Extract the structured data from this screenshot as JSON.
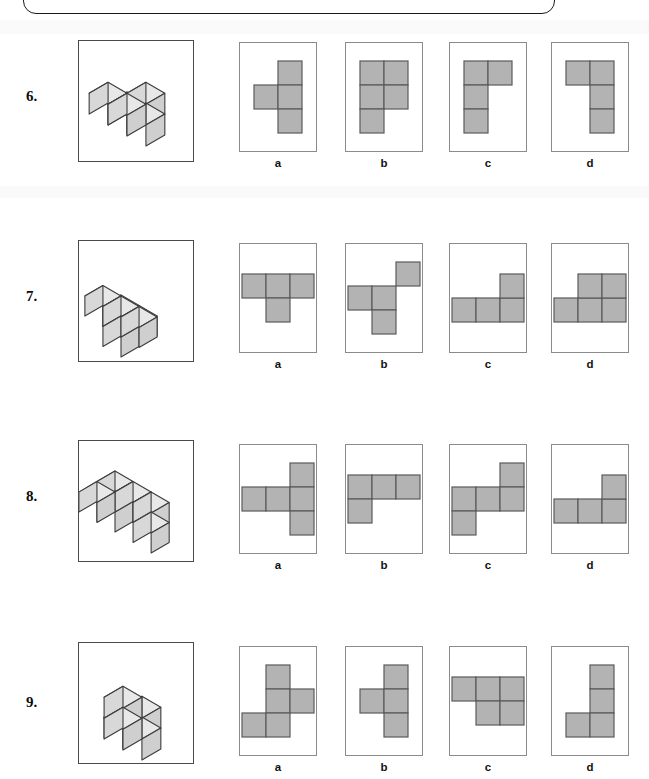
{
  "worksheet": {
    "kind": "spatial-visualization-multiple-choice",
    "instruction_box": {
      "present": true,
      "text": "",
      "note": "rounded box cropped at top of page"
    },
    "option_letters": [
      "a",
      "b",
      "c",
      "d"
    ],
    "colors": {
      "cell_fill": "#b3b3b3",
      "cell_stroke": "#5a5a5a",
      "panel_border": "#8b8b8b",
      "figure_border": "#4a4a4a",
      "cube_top": "#e8e8e8",
      "cube_front": "#d8d8d8",
      "cube_side": "#cfcfcf",
      "cube_stroke": "#3c3c3c",
      "text": "#111111",
      "page_background": "#ffffff"
    }
  },
  "questions": [
    {
      "number": "6.",
      "figure": {
        "name": "cube-stack-6",
        "cubes": [
          [
            0,
            0,
            0
          ],
          [
            1,
            0,
            0
          ],
          [
            1,
            0,
            1
          ],
          [
            0,
            1,
            1
          ],
          [
            1,
            1,
            1
          ]
        ]
      },
      "options": [
        {
          "letter": "a",
          "cells": [
            [
              1,
              0
            ],
            [
              0,
              1
            ],
            [
              1,
              1
            ],
            [
              1,
              2
            ]
          ],
          "cols": 2,
          "rows": 3
        },
        {
          "letter": "b",
          "cells": [
            [
              0,
              0
            ],
            [
              1,
              0
            ],
            [
              0,
              1
            ],
            [
              1,
              1
            ],
            [
              0,
              2
            ]
          ],
          "cols": 2,
          "rows": 3
        },
        {
          "letter": "c",
          "cells": [
            [
              0,
              0
            ],
            [
              1,
              0
            ],
            [
              0,
              1
            ],
            [
              0,
              2
            ]
          ],
          "cols": 2,
          "rows": 3
        },
        {
          "letter": "d",
          "cells": [
            [
              0,
              0
            ],
            [
              1,
              0
            ],
            [
              1,
              1
            ],
            [
              1,
              2
            ]
          ],
          "cols": 2,
          "rows": 3
        }
      ]
    },
    {
      "number": "7.",
      "figure": {
        "name": "cube-stack-7",
        "cubes": [
          [
            0,
            0,
            0
          ],
          [
            1,
            0,
            0
          ],
          [
            1,
            1,
            0
          ],
          [
            0,
            1,
            1
          ],
          [
            1,
            1,
            1
          ],
          [
            2,
            1,
            1
          ]
        ]
      },
      "options": [
        {
          "letter": "a",
          "cells": [
            [
              0,
              0
            ],
            [
              1,
              0
            ],
            [
              2,
              0
            ],
            [
              1,
              1
            ]
          ],
          "cols": 3,
          "rows": 2
        },
        {
          "letter": "b",
          "cells": [
            [
              0,
              0
            ],
            [
              1,
              0
            ],
            [
              2,
              -1
            ],
            [
              1,
              1
            ]
          ],
          "cols": 3,
          "rows": 3
        },
        {
          "letter": "c",
          "cells": [
            [
              0,
              1
            ],
            [
              1,
              1
            ],
            [
              2,
              1
            ],
            [
              2,
              0
            ]
          ],
          "cols": 3,
          "rows": 2
        },
        {
          "letter": "d",
          "cells": [
            [
              0,
              1
            ],
            [
              1,
              1
            ],
            [
              2,
              1
            ],
            [
              1,
              0
            ],
            [
              2,
              0
            ]
          ],
          "cols": 3,
          "rows": 2
        }
      ]
    },
    {
      "number": "8.",
      "figure": {
        "name": "cube-stack-8",
        "cubes": [
          [
            0,
            0,
            0
          ],
          [
            2,
            0,
            0
          ],
          [
            0,
            0,
            1
          ],
          [
            1,
            0,
            1
          ],
          [
            2,
            0,
            1
          ],
          [
            0,
            1,
            1
          ]
        ]
      },
      "options": [
        {
          "letter": "a",
          "cells": [
            [
              0,
              1
            ],
            [
              1,
              1
            ],
            [
              2,
              0
            ],
            [
              2,
              1
            ],
            [
              2,
              2
            ]
          ],
          "cols": 3,
          "rows": 3
        },
        {
          "letter": "b",
          "cells": [
            [
              0,
              0
            ],
            [
              1,
              0
            ],
            [
              2,
              0
            ],
            [
              0,
              1
            ]
          ],
          "cols": 3,
          "rows": 2
        },
        {
          "letter": "c",
          "cells": [
            [
              0,
              1
            ],
            [
              1,
              1
            ],
            [
              2,
              0
            ],
            [
              2,
              1
            ],
            [
              0,
              2
            ]
          ],
          "cols": 3,
          "rows": 3
        },
        {
          "letter": "d",
          "cells": [
            [
              0,
              1
            ],
            [
              1,
              1
            ],
            [
              2,
              1
            ],
            [
              2,
              0
            ]
          ],
          "cols": 3,
          "rows": 2
        }
      ]
    },
    {
      "number": "9.",
      "figure": {
        "name": "cube-stack-9",
        "cubes": [
          [
            0,
            0,
            0
          ],
          [
            1,
            0,
            0
          ],
          [
            1,
            0,
            1
          ],
          [
            1,
            1,
            1
          ],
          [
            1,
            1,
            2
          ]
        ]
      },
      "options": [
        {
          "letter": "a",
          "cells": [
            [
              1,
              0
            ],
            [
              1,
              1
            ],
            [
              2,
              1
            ],
            [
              0,
              2
            ],
            [
              1,
              2
            ]
          ],
          "cols": 3,
          "rows": 3
        },
        {
          "letter": "b",
          "cells": [
            [
              1,
              0
            ],
            [
              0,
              1
            ],
            [
              1,
              1
            ],
            [
              1,
              2
            ]
          ],
          "cols": 2,
          "rows": 3
        },
        {
          "letter": "c",
          "cells": [
            [
              0,
              0
            ],
            [
              1,
              0
            ],
            [
              2,
              0
            ],
            [
              1,
              1
            ],
            [
              2,
              1
            ]
          ],
          "cols": 3,
          "rows": 2
        },
        {
          "letter": "d",
          "cells": [
            [
              1,
              0
            ],
            [
              1,
              1
            ],
            [
              0,
              2
            ],
            [
              1,
              2
            ]
          ],
          "cols": 2,
          "rows": 3
        }
      ]
    }
  ]
}
